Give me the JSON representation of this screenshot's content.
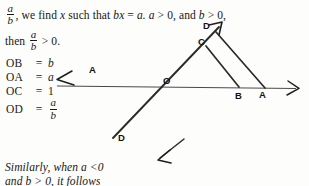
{
  "page": {
    "background_color": "#fdfdfc",
    "ink_color": "#171717"
  },
  "body_text": {
    "line1_prefix": ", we find ",
    "line1_var": "x",
    "line1_mid": " such that ",
    "line1_eq_lhs": "bx",
    "line1_eq_sign": " = ",
    "line1_eq_rhs": "a.",
    "line1_cond1": "a",
    "line1_cond1_rel": " > 0, and ",
    "line1_cond2": "b",
    "line1_cond2_rel": " > 0,",
    "line2_prefix": "then ",
    "line2_rel": " > 0.",
    "frac1": {
      "numerator": "a",
      "denominator": "b"
    },
    "frac2": {
      "numerator": "a",
      "denominator": "b"
    }
  },
  "equations": [
    {
      "lhs": "OB",
      "sign": "=",
      "rhs": "b",
      "rhs_type": "italic"
    },
    {
      "lhs": "OA",
      "sign": "=",
      "rhs": "a",
      "rhs_type": "italic"
    },
    {
      "lhs": "OC",
      "sign": "=",
      "rhs": "1",
      "rhs_type": "plain"
    },
    {
      "lhs": "OD",
      "sign": "=",
      "rhs_type": "fraction",
      "numerator": "a",
      "denominator": "b"
    }
  ],
  "diagram": {
    "caption_points": [
      {
        "name": "point-label-A-axis-left",
        "text": "A",
        "x": 89,
        "y": 64
      },
      {
        "name": "point-label-O",
        "text": "O",
        "x": 163,
        "y": 75
      },
      {
        "name": "point-label-C",
        "text": "C",
        "x": 198,
        "y": 36
      },
      {
        "name": "point-label-D-upper",
        "text": "D",
        "x": 203,
        "y": 20
      },
      {
        "name": "point-label-B",
        "text": "B",
        "x": 235,
        "y": 90
      },
      {
        "name": "point-label-A",
        "text": "A",
        "x": 259,
        "y": 89
      },
      {
        "name": "point-label-D-lower",
        "text": "D",
        "x": 118,
        "y": 132
      }
    ]
  },
  "closing_text": {
    "line1": "Similarly, when a <0",
    "line2": "and b > 0, it follows"
  }
}
